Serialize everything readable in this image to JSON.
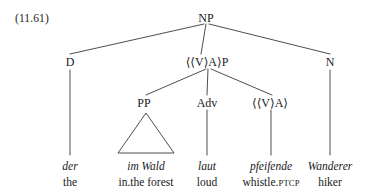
{
  "figure": {
    "example_number": "(11.61)",
    "type": "syntax-tree",
    "language": "German",
    "line_color": "#3a3a3a",
    "text_color": "#1a1a1a",
    "background_color": "#ffffff"
  },
  "tree": {
    "nodes": [
      {
        "id": "np",
        "label": "NP",
        "x": 206,
        "y": 18,
        "level": 0
      },
      {
        "id": "d",
        "label": "D",
        "x": 70,
        "y": 62,
        "level": 1
      },
      {
        "id": "vap",
        "label": "⟨⟨V⟩A⟩P",
        "x": 207,
        "y": 62,
        "level": 1
      },
      {
        "id": "n",
        "label": "N",
        "x": 330,
        "y": 62,
        "level": 1
      },
      {
        "id": "pp",
        "label": "PP",
        "x": 144,
        "y": 103,
        "level": 2
      },
      {
        "id": "adv",
        "label": "Adv",
        "x": 207,
        "y": 103,
        "level": 2
      },
      {
        "id": "va",
        "label": "⟨⟨V⟩A⟩",
        "x": 270,
        "y": 103,
        "level": 2
      }
    ],
    "edges": [
      {
        "from": "np",
        "to": "d",
        "x1": 204,
        "y1": 24,
        "x2": 70,
        "y2": 54
      },
      {
        "from": "np",
        "to": "vap",
        "x1": 206,
        "y1": 24,
        "x2": 201,
        "y2": 54
      },
      {
        "from": "np",
        "to": "n",
        "x1": 209,
        "y1": 24,
        "x2": 330,
        "y2": 54
      },
      {
        "from": "vap",
        "to": "pp",
        "x1": 206,
        "y1": 69,
        "x2": 146,
        "y2": 95
      },
      {
        "from": "vap",
        "to": "adv",
        "x1": 208,
        "y1": 69,
        "x2": 207,
        "y2": 95
      },
      {
        "from": "vap",
        "to": "va",
        "x1": 211,
        "y1": 69,
        "x2": 272,
        "y2": 95
      },
      {
        "from": "d",
        "to": "der",
        "x1": 70,
        "y1": 70,
        "x2": 70,
        "y2": 155
      },
      {
        "from": "adv",
        "to": "laut",
        "x1": 207,
        "y1": 110,
        "x2": 207,
        "y2": 155
      },
      {
        "from": "va",
        "to": "pfeifende",
        "x1": 271,
        "y1": 110,
        "x2": 271,
        "y2": 155
      },
      {
        "from": "n",
        "to": "wanderer",
        "x1": 330,
        "y1": 70,
        "x2": 330,
        "y2": 155
      }
    ],
    "triangle": {
      "label": "pp-triangle",
      "apex_x": 146,
      "apex_y": 113,
      "left_x": 118,
      "right_x": 174,
      "base_y": 153
    }
  },
  "leaves": [
    {
      "id": "der",
      "form": "der",
      "gloss": "the",
      "x": 70,
      "y": 160
    },
    {
      "id": "im-wald",
      "form": "im Wald",
      "gloss": "in.the forest",
      "x": 146,
      "y": 160
    },
    {
      "id": "laut",
      "form": "laut",
      "gloss": "loud",
      "x": 207,
      "y": 160
    },
    {
      "id": "pfeifende",
      "form": "pfeifende",
      "gloss": "whistle.",
      "gloss_smallcaps": "PTCP",
      "x": 271,
      "y": 160
    },
    {
      "id": "wanderer",
      "form": "Wanderer",
      "gloss": "hiker",
      "x": 330,
      "y": 160
    }
  ]
}
